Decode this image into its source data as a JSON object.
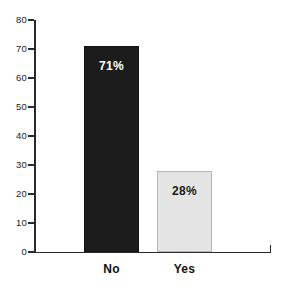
{
  "chart_data": {
    "type": "bar",
    "title": "",
    "subtitle": "",
    "xlabel": "",
    "ylabel": "",
    "categories": [
      "No",
      "Yes"
    ],
    "values": [
      71,
      28
    ],
    "data_labels": [
      "71%",
      "28%"
    ],
    "ylim": [
      0,
      80
    ],
    "yticks": [
      0,
      10,
      20,
      30,
      40,
      50,
      60,
      70,
      80
    ],
    "ytick_labels": [
      "0",
      "10",
      "20",
      "30",
      "40",
      "50",
      "60",
      "70",
      "80"
    ],
    "grid": false,
    "legend": "none",
    "bar_colors": [
      "#1c1c1c",
      "#e4e4e4"
    ],
    "bar_border_colors": [
      "#141414",
      "#b6b6b6"
    ],
    "label_text_colors": [
      "#ffffff",
      "#1a1a1a"
    ],
    "axis_color": "#2b2b2b"
  }
}
